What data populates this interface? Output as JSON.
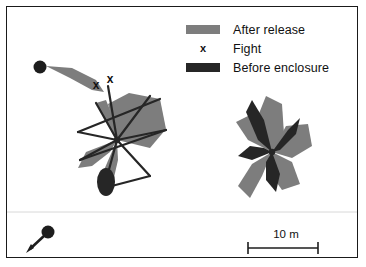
{
  "figure": {
    "background": "#ffffff",
    "border_color": "#1a1a1a"
  },
  "legend": {
    "items": [
      {
        "key": "after_release",
        "label": "After release",
        "marker": "bar",
        "color": "#7d7d7d"
      },
      {
        "key": "fight",
        "label": "Fight",
        "marker": "x",
        "glyph": "x",
        "color": "#111111"
      },
      {
        "key": "before_enclosure",
        "label": "Before enclosure",
        "marker": "bar",
        "color": "#262626"
      }
    ]
  },
  "scale_bar": {
    "label": "10 m",
    "length_px": 70,
    "value": 10,
    "unit": "m"
  },
  "north_arrow": {
    "name": "release-point-arrow",
    "description": "dot with arrow pointing down-left"
  },
  "chart_data": {
    "type": "scatter",
    "xlabel": "",
    "ylabel": "",
    "grid": false,
    "legend_position": "top-right",
    "scale": {
      "bar_label": "10 m",
      "bar_value": 10,
      "bar_unit": "m",
      "bar_px": 70
    },
    "clusters": [
      {
        "name": "left-cluster",
        "hub": [
          117,
          140
        ],
        "start_point": [
          40,
          67
        ],
        "fight_marks": [
          [
            96,
            89
          ],
          [
            110,
            83
          ]
        ],
        "after_release_lobes": [
          [
            [
              46,
              66
            ],
            [
              72,
              68
            ],
            [
              96,
              80
            ],
            [
              104,
              92
            ],
            [
              92,
              90
            ],
            [
              70,
              78
            ]
          ],
          [
            [
              117,
              140
            ],
            [
              108,
              104
            ],
            [
              129,
              93
            ],
            [
              160,
              99
            ],
            [
              166,
              129
            ],
            [
              150,
              148
            ]
          ],
          [
            [
              117,
              140
            ],
            [
              96,
              103
            ],
            [
              106,
              100
            ],
            [
              114,
              120
            ]
          ],
          [
            [
              117,
              140
            ],
            [
              86,
              152
            ],
            [
              78,
              168
            ],
            [
              92,
              166
            ],
            [
              110,
              152
            ]
          ],
          [
            [
              117,
              140
            ],
            [
              104,
              170
            ],
            [
              100,
              188
            ],
            [
              112,
              186
            ],
            [
              118,
              160
            ]
          ]
        ],
        "before_enclosure_lines": [
          [
            [
              117,
              140
            ],
            [
              150,
              96
            ]
          ],
          [
            [
              117,
              140
            ],
            [
              166,
              130
            ]
          ],
          [
            [
              117,
              140
            ],
            [
              150,
              176
            ]
          ],
          [
            [
              117,
              140
            ],
            [
              104,
              188
            ]
          ],
          [
            [
              117,
              140
            ],
            [
              80,
              160
            ]
          ],
          [
            [
              117,
              140
            ],
            [
              78,
              132
            ]
          ],
          [
            [
              117,
              140
            ],
            [
              96,
              103
            ]
          ],
          [
            [
              117,
              140
            ],
            [
              108,
              86
            ]
          ],
          [
            [
              78,
              132
            ],
            [
              160,
              99
            ]
          ],
          [
            [
              80,
              160
            ],
            [
              166,
              130
            ]
          ],
          [
            [
              104,
              188
            ],
            [
              150,
              176
            ]
          ]
        ],
        "dark_blobs": [
          [
            106,
            182,
            9,
            14
          ]
        ]
      },
      {
        "name": "right-cluster",
        "hub": [
          272,
          152
        ],
        "after_release_lobes": [
          [
            [
              272,
              152
            ],
            [
              258,
              116
            ],
            [
              266,
              96
            ],
            [
              282,
              104
            ],
            [
              284,
              134
            ]
          ],
          [
            [
              272,
              152
            ],
            [
              286,
              126
            ],
            [
              308,
              124
            ],
            [
              312,
              146
            ],
            [
              292,
              158
            ]
          ],
          [
            [
              272,
              152
            ],
            [
              292,
              162
            ],
            [
              300,
              184
            ],
            [
              282,
              190
            ],
            [
              268,
              170
            ]
          ],
          [
            [
              272,
              152
            ],
            [
              262,
              176
            ],
            [
              250,
              198
            ],
            [
              238,
              186
            ],
            [
              252,
              164
            ]
          ],
          [
            [
              272,
              152
            ],
            [
              248,
              140
            ],
            [
              236,
              122
            ],
            [
              248,
              116
            ],
            [
              262,
              136
            ]
          ]
        ],
        "before_enclosure_lobes": [
          [
            [
              272,
              152
            ],
            [
              264,
              120
            ],
            [
              252,
              100
            ],
            [
              246,
              112
            ],
            [
              258,
              140
            ]
          ],
          [
            [
              272,
              152
            ],
            [
              288,
              130
            ],
            [
              300,
              118
            ],
            [
              296,
              134
            ],
            [
              280,
              150
            ]
          ],
          [
            [
              272,
              152
            ],
            [
              280,
              174
            ],
            [
              276,
              192
            ],
            [
              266,
              180
            ],
            [
              266,
              162
            ]
          ],
          [
            [
              272,
              152
            ],
            [
              252,
              160
            ],
            [
              238,
              156
            ],
            [
              250,
              146
            ],
            [
              264,
              148
            ]
          ]
        ]
      }
    ]
  }
}
